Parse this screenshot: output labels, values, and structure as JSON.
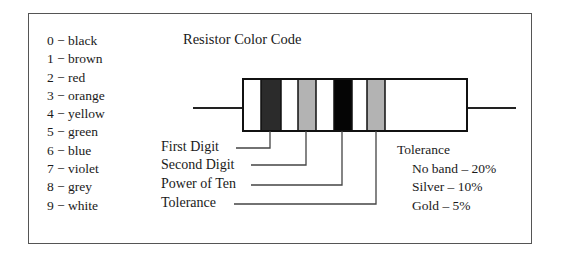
{
  "title": "Resistor Color Code",
  "color_codes": [
    {
      "digit": "0",
      "color": "black"
    },
    {
      "digit": "1",
      "color": "brown"
    },
    {
      "digit": "2",
      "color": "red"
    },
    {
      "digit": "3",
      "color": "orange"
    },
    {
      "digit": "4",
      "color": "yellow"
    },
    {
      "digit": "5",
      "color": "green"
    },
    {
      "digit": "6",
      "color": "blue"
    },
    {
      "digit": "7",
      "color": "violet"
    },
    {
      "digit": "8",
      "color": "grey"
    },
    {
      "digit": "9",
      "color": "white"
    }
  ],
  "color_code_lines": [
    "0 − black",
    "1 − brown",
    "2 − red",
    "3 − orange",
    "4 − yellow",
    "5 − green",
    "6 − blue",
    "7 − violet",
    "8 − grey",
    "9 − white"
  ],
  "band_labels": [
    "First Digit",
    "Second Digit",
    "Power of Ten",
    "Tolerance"
  ],
  "bands": [
    {
      "name": "first-digit",
      "fill": "#2b2b2b"
    },
    {
      "name": "second-digit",
      "fill": "#b3b3b3"
    },
    {
      "name": "power-of-ten",
      "fill": "#050505"
    },
    {
      "name": "tolerance",
      "fill": "#b3b3b3"
    }
  ],
  "tolerance": {
    "heading": "Tolerance",
    "items": [
      "No band – 20%",
      "Silver – 10%",
      "Gold – 5%"
    ]
  }
}
